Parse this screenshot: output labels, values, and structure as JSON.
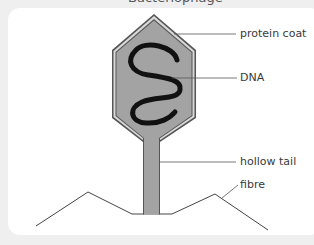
{
  "diagram": {
    "title_partial": "Bacteriophage",
    "labels": {
      "protein_coat": "protein coat",
      "dna": "DNA",
      "hollow_tail": "hollow tail",
      "fibre": "fibre"
    },
    "colors": {
      "background": "#efefef",
      "card": "#ffffff",
      "coat_fill": "#a3a3a3",
      "coat_outline": "#555555",
      "coat_inner_band": "#d6d6d6",
      "dna": "#111111",
      "tail_fill": "#a3a3a3",
      "lines": "#444444",
      "label_text": "#3a3a3a"
    }
  }
}
